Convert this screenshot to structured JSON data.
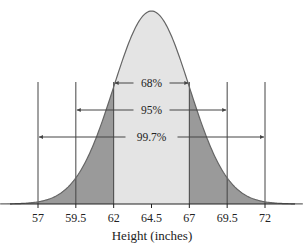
{
  "chart_data": {
    "type": "area",
    "title": "",
    "xlabel": "Height (inches)",
    "ylabel": "",
    "distribution": "normal",
    "mean": 64.5,
    "sd": 2.5,
    "xlim": [
      54.5,
      74.5
    ],
    "x_ticks": [
      57,
      59.5,
      62,
      64.5,
      67,
      69.5,
      72
    ],
    "x_tick_labels": [
      "57",
      "59.5",
      "62",
      "64.5",
      "67",
      "69.5",
      "72"
    ],
    "grid": false,
    "shaded_regions": [
      {
        "name": "within-1-sd",
        "from": 62,
        "to": 67,
        "color": "#e4e4e4"
      },
      {
        "name": "outside-1-sd",
        "from": 54.5,
        "to": 74.5,
        "color": "#9a9a9a"
      }
    ],
    "intervals": [
      {
        "label": "68%",
        "from": 62,
        "to": 67
      },
      {
        "label": "95%",
        "from": 59.5,
        "to": 69.5
      },
      {
        "label": "99.7%",
        "from": 57,
        "to": 72
      }
    ],
    "colors": {
      "center_fill": "#e4e4e4",
      "tail_fill": "#9a9a9a",
      "curve_stroke": "#666666",
      "line": "#444444"
    }
  }
}
